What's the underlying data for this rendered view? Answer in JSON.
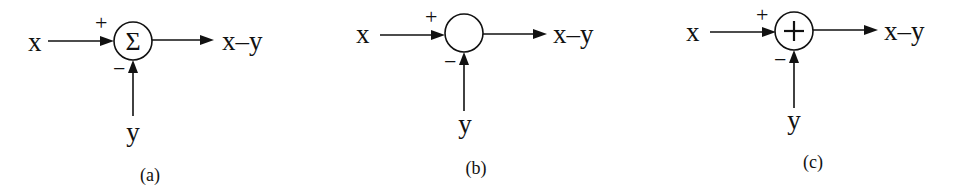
{
  "diagrams": [
    {
      "id": "a",
      "caption": "(a)",
      "input_x": "x",
      "input_y": "y",
      "output": "x–y",
      "plus_sign": "+",
      "minus_sign": "−",
      "symbol": "Σ",
      "symbol_type": "sigma",
      "center": [
        133,
        41
      ]
    },
    {
      "id": "b",
      "caption": "(b)",
      "input_x": "x",
      "input_y": "y",
      "output": "x–y",
      "plus_sign": "+",
      "minus_sign": "−",
      "symbol": "",
      "symbol_type": "empty",
      "center": [
        464,
        33
      ]
    },
    {
      "id": "c",
      "caption": "(c)",
      "input_x": "x",
      "input_y": "y",
      "output": "x–y",
      "plus_sign": "+",
      "minus_sign": "−",
      "symbol": "+",
      "symbol_type": "cross",
      "center": [
        794,
        31
      ]
    }
  ],
  "colors": {
    "stroke": "#111111",
    "background": "#ffffff"
  }
}
